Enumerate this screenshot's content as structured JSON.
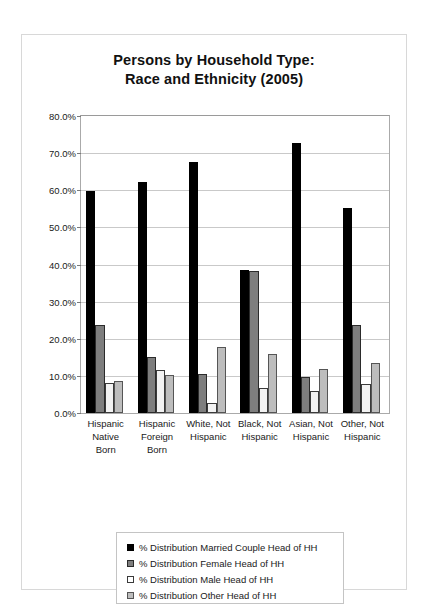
{
  "chart_data": {
    "type": "bar",
    "title": "Persons by Household Type: Race and Ethnicity (2005)",
    "title_line1": "Persons by Household Type:",
    "title_line2": "Race and Ethnicity (2005)",
    "xlabel": "",
    "ylabel": "",
    "ylim": [
      0,
      80
    ],
    "ytick_labels": [
      "80.0%",
      "70.0%",
      "60.0%",
      "50.0%",
      "40.0%",
      "30.0%",
      "20.0%",
      "10.0%",
      "0.0%"
    ],
    "ytick_values": [
      80,
      70,
      60,
      50,
      40,
      30,
      20,
      10,
      0
    ],
    "grid": true,
    "legend_position": "bottom",
    "categories": [
      "Hispanic Native Born",
      "Hispanic Foreign Born",
      "White, Not Hispanic",
      "Black, Not Hispanic",
      "Asian, Not Hispanic",
      "Other, Not Hispanic"
    ],
    "category_lines": [
      [
        "Hispanic",
        "Native",
        "Born"
      ],
      [
        "Hispanic",
        "Foreign",
        "Born"
      ],
      [
        "White, Not",
        "Hispanic"
      ],
      [
        "Black, Not",
        "Hispanic"
      ],
      [
        "Asian, Not",
        "Hispanic"
      ],
      [
        "Other, Not",
        "Hispanic"
      ]
    ],
    "series": [
      {
        "name": "% Distribution Married Couple Head of  HH",
        "color": "#000000",
        "values": [
          59.8,
          62.3,
          67.5,
          38.5,
          72.7,
          55.2
        ]
      },
      {
        "name": "% Distribution Female  Head of HH",
        "color": "#7e7e7e",
        "values": [
          23.7,
          15.1,
          10.4,
          38.3,
          9.6,
          23.6
        ]
      },
      {
        "name": "% Distribution Male Head of HH",
        "color": "#f2f2f2",
        "values": [
          8.0,
          11.6,
          2.6,
          6.8,
          5.9,
          7.7
        ]
      },
      {
        "name": "% Distribution Other Head of HH",
        "color": "#bdbdbd",
        "values": [
          8.6,
          10.3,
          17.9,
          15.8,
          11.8,
          13.4
        ]
      }
    ]
  }
}
